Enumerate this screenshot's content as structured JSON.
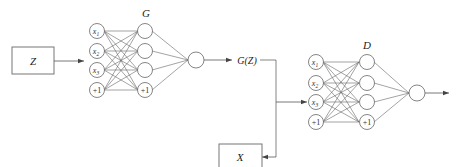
{
  "diagram": {
    "blocks": {
      "noise_input": "Z",
      "real_data": "X",
      "generator_output": "G(Z)"
    },
    "generator": {
      "label": "G",
      "input_nodes": [
        "x1",
        "x2",
        "x3",
        "+1"
      ],
      "hidden_nodes": [
        "",
        "",
        "",
        "+1"
      ],
      "output_nodes": [
        ""
      ]
    },
    "discriminator": {
      "label": "D",
      "input_nodes": [
        "x1",
        "x2",
        "x3",
        "+1"
      ],
      "hidden_nodes": [
        "",
        "",
        "",
        "+1"
      ],
      "output_nodes": [
        ""
      ]
    },
    "colors": {
      "stroke": "#555555",
      "text": "#222222",
      "background": "#ffffff"
    }
  }
}
